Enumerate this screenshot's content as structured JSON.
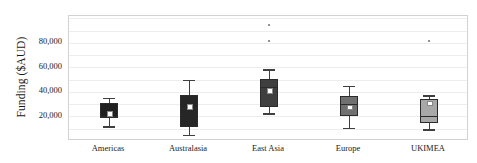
{
  "chart_data": {
    "type": "box",
    "title": "",
    "xlabel": "",
    "ylabel": "Funding ($AUD)",
    "ylim": [
      0,
      102000
    ],
    "y_ticks": [
      {
        "value": 20000,
        "label": "20,000"
      },
      {
        "value": 40000,
        "label": "40,000"
      },
      {
        "value": 60000,
        "label": "60,000"
      },
      {
        "value": 80000,
        "label": "80,000"
      }
    ],
    "gridlines": [
      10000,
      20000,
      30000,
      40000,
      50000,
      60000,
      70000,
      80000,
      90000,
      100000
    ],
    "grid": true,
    "legend": "none",
    "categories": [
      "Americas",
      "Australasia",
      "East Asia",
      "Europe",
      "UKIMEA"
    ],
    "boxes": [
      {
        "category": "Americas",
        "whisker_low": 12000,
        "q1": 18500,
        "median": 20500,
        "mean": 23000,
        "q3": 31000,
        "whisker_high": 35500,
        "outliers": [],
        "fill": "#1f1f1f"
      },
      {
        "category": "Australasia",
        "whisker_low": 5000,
        "q1": 11500,
        "median": 27000,
        "mean": 28500,
        "q3": 37500,
        "whisker_high": 50000,
        "outliers": [],
        "fill": "#262626"
      },
      {
        "category": "East Asia",
        "whisker_low": 22500,
        "q1": 27500,
        "median": 44000,
        "mean": 41500,
        "q3": 50500,
        "whisker_high": 58500,
        "outliers": [
          82000,
          95000
        ],
        "fill": "#3f3f3f"
      },
      {
        "category": "Europe",
        "whisker_low": 11000,
        "q1": 20000,
        "median": 30000,
        "mean": 28000,
        "q3": 37000,
        "whisker_high": 45000,
        "outliers": [],
        "fill": "#707070"
      },
      {
        "category": "UKIMEA",
        "whisker_low": 9500,
        "q1": 14500,
        "median": 20500,
        "mean": 31500,
        "q3": 34000,
        "whisker_high": 37500,
        "outliers": [
          82000
        ],
        "fill": "#a8a8a8"
      }
    ],
    "colors": {
      "plot_border": "#d2d2d2",
      "gridline": "#ededed",
      "text": "#1a1a1a",
      "whisker": "#3f3f3f",
      "mean_marker": "#ffffff",
      "outlier": "#6e6e6e"
    }
  }
}
